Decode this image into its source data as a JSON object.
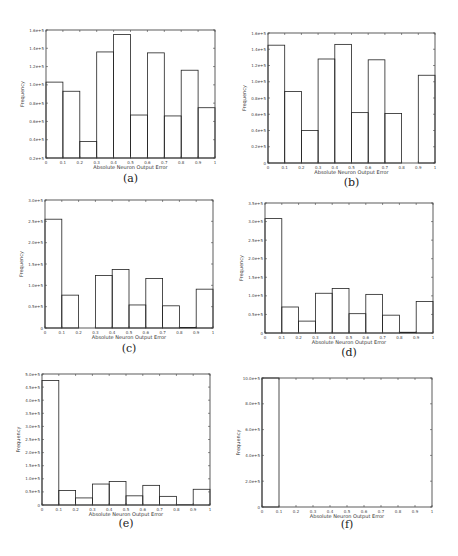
{
  "chart_data": [
    {
      "type": "bar",
      "panel": "(a)",
      "caption": "(a)",
      "xlabel": "Absolute Neuron Output Error",
      "ylabel": "Frequency",
      "bin_edges": [
        0,
        0.1,
        0.2,
        0.3,
        0.4,
        0.5,
        0.6,
        0.7,
        0.8,
        0.9,
        1
      ],
      "xticks": [
        "0",
        "0.1",
        "0.2",
        "0.3",
        "0.4",
        "0.5",
        "0.6",
        "0.7",
        "0.8",
        "0.9",
        "1"
      ],
      "values": [
        103000,
        93000,
        38000,
        136000,
        155000,
        67000,
        135000,
        66000,
        116000,
        75000
      ],
      "ylim": [
        20000,
        160000
      ],
      "yticks": [
        20000,
        40000,
        60000,
        80000,
        100000,
        120000,
        140000,
        160000
      ],
      "yticklabels": [
        "0.2e+5",
        "0.4e+5",
        "0.6e+5",
        "0.8e+5",
        "1.0e+5",
        "1.2e+5",
        "1.4e+5",
        "1.6e+5"
      ]
    },
    {
      "type": "bar",
      "panel": "(b)",
      "caption": "(b)",
      "xlabel": "Absolute Neuron Output Error",
      "ylabel": "Frequency",
      "bin_edges": [
        0,
        0.1,
        0.2,
        0.3,
        0.4,
        0.5,
        0.6,
        0.7,
        0.8,
        0.9,
        1
      ],
      "xticks": [
        "0",
        "0.1",
        "0.2",
        "0.3",
        "0.4",
        "0.5",
        "0.6",
        "0.7",
        "0.8",
        "0.9",
        "1"
      ],
      "values": [
        145000,
        88000,
        40000,
        128000,
        146000,
        62000,
        127000,
        61000,
        0,
        108000
      ],
      "ylim": [
        0,
        160000
      ],
      "yticks": [
        0,
        20000,
        40000,
        60000,
        80000,
        100000,
        120000,
        140000,
        160000
      ],
      "yticklabels": [
        "0",
        "0.2e+5",
        "0.4e+5",
        "0.6e+5",
        "0.8e+5",
        "1.0e+5",
        "1.2e+5",
        "1.4e+5",
        "1.6e+5"
      ]
    },
    {
      "type": "bar",
      "panel": "(c)",
      "caption": "(c)",
      "xlabel": "Absolute Neuron Output Error",
      "ylabel": "Frequency",
      "bin_edges": [
        0,
        0.1,
        0.2,
        0.3,
        0.4,
        0.5,
        0.6,
        0.7,
        0.8,
        0.9,
        1
      ],
      "xticks": [
        "0",
        "0.1",
        "0.2",
        "0.3",
        "0.4",
        "0.5",
        "0.6",
        "0.7",
        "0.8",
        "0.9",
        "1"
      ],
      "values": [
        255000,
        77000,
        0,
        123000,
        137000,
        54000,
        116000,
        52000,
        1000,
        91000
      ],
      "ylim": [
        0,
        300000
      ],
      "yticks": [
        0,
        50000,
        100000,
        150000,
        200000,
        250000,
        300000
      ],
      "yticklabels": [
        "0",
        "0.5e+5",
        "1.0e+5",
        "1.5e+5",
        "2.0e+5",
        "2.5e+5",
        "3.0e+5"
      ]
    },
    {
      "type": "bar",
      "panel": "(d)",
      "caption": "(d)",
      "xlabel": "Absolute Neuron Output Error",
      "ylabel": "Frequency",
      "bin_edges": [
        0,
        0.1,
        0.2,
        0.3,
        0.4,
        0.5,
        0.6,
        0.7,
        0.8,
        0.9,
        1
      ],
      "xticks": [
        "0",
        "0.1",
        "0.2",
        "0.3",
        "0.4",
        "0.5",
        "0.6",
        "0.7",
        "0.8",
        "0.9",
        "1"
      ],
      "values": [
        308000,
        70000,
        32000,
        107000,
        120000,
        52000,
        104000,
        48000,
        2000,
        85000
      ],
      "ylim": [
        0,
        350000
      ],
      "yticks": [
        0,
        50000,
        100000,
        150000,
        200000,
        250000,
        300000,
        350000
      ],
      "yticklabels": [
        "0",
        "0.5e+5",
        "1.0e+5",
        "1.5e+5",
        "2.0e+5",
        "2.5e+5",
        "3.0e+5",
        "3.5e+5"
      ]
    },
    {
      "type": "bar",
      "panel": "(e)",
      "caption": "(e)",
      "xlabel": "Absolute Neuron Output Error",
      "ylabel": "Frequency",
      "bin_edges": [
        0,
        0.1,
        0.2,
        0.3,
        0.4,
        0.5,
        0.6,
        0.7,
        0.8,
        0.9,
        1
      ],
      "xticks": [
        "0",
        "0.1",
        "0.2",
        "0.3",
        "0.4",
        "0.5",
        "0.6",
        "0.7",
        "0.8",
        "0.9",
        "1"
      ],
      "values": [
        475000,
        55000,
        27000,
        80000,
        90000,
        35000,
        75000,
        33000,
        1000,
        60000
      ],
      "ylim": [
        0,
        500000
      ],
      "yticks": [
        0,
        50000,
        100000,
        150000,
        200000,
        250000,
        300000,
        350000,
        400000,
        450000,
        500000
      ],
      "yticklabels": [
        "0",
        "0.5e+5",
        "1.0e+5",
        "1.5e+5",
        "2.0e+5",
        "2.5e+5",
        "3.0e+5",
        "3.5e+5",
        "4.0e+5",
        "4.5e+5",
        "5.0e+5"
      ]
    },
    {
      "type": "bar",
      "panel": "(f)",
      "caption": "(f)",
      "xlabel": "Absolute Neuron Output Error",
      "ylabel": "Frequency",
      "bin_edges": [
        0,
        0.1,
        0.2,
        0.3,
        0.4,
        0.5,
        0.6,
        0.7,
        0.8,
        0.9,
        1
      ],
      "xticks": [
        "0",
        "0.1",
        "0.2",
        "0.3",
        "0.4",
        "0.5",
        "0.6",
        "0.7",
        "0.8",
        "0.9",
        "1"
      ],
      "values": [
        1000000,
        0,
        0,
        0,
        0,
        0,
        0,
        0,
        0,
        0
      ],
      "ylim": [
        0,
        1000000
      ],
      "yticks": [
        0,
        200000,
        400000,
        600000,
        800000,
        1000000
      ],
      "yticklabels": [
        "0",
        "2.0e+5",
        "4.0e+5",
        "6.0e+5",
        "8.0e+5",
        "10.0e+5"
      ]
    }
  ]
}
